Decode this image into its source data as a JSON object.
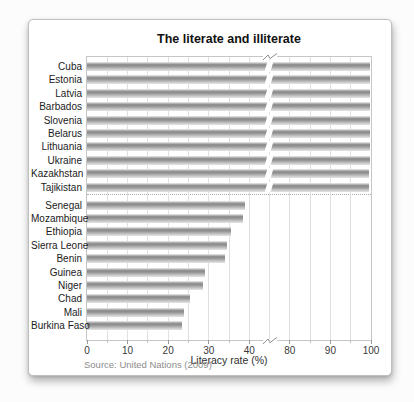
{
  "card": {
    "title": "The literate and illiterate",
    "xlabel": "Literacy rate (%)",
    "source": "Source: United Nations (2009)"
  },
  "chart_data": {
    "type": "bar",
    "orientation": "horizontal",
    "title": "The literate and illiterate",
    "xlabel": "Literacy rate (%)",
    "source": "Source: United Nations (2009)",
    "axis": {
      "unit": "%",
      "tick_labels": [
        "0",
        "10",
        "20",
        "30",
        "40",
        "80",
        "90",
        "100"
      ],
      "tick_slots": [
        0,
        2,
        4,
        6,
        8,
        10,
        12,
        14
      ],
      "slots_total": 14,
      "units_per_slot": 5,
      "break": {
        "between": [
          40,
          80
        ],
        "slot": 9
      },
      "gridlines": true,
      "separator_after_group": 0
    },
    "groups": [
      {
        "label": "high literacy",
        "rows": [
          {
            "country": "Cuba",
            "value": 99.8
          },
          {
            "country": "Estonia",
            "value": 99.8
          },
          {
            "country": "Latvia",
            "value": 99.8
          },
          {
            "country": "Barbados",
            "value": 99.7
          },
          {
            "country": "Slovenia",
            "value": 99.7
          },
          {
            "country": "Belarus",
            "value": 99.7
          },
          {
            "country": "Lithuania",
            "value": 99.7
          },
          {
            "country": "Ukraine",
            "value": 99.7
          },
          {
            "country": "Kazakhstan",
            "value": 99.6
          },
          {
            "country": "Tajikistan",
            "value": 99.6
          }
        ]
      },
      {
        "label": "low literacy",
        "rows": [
          {
            "country": "Senegal",
            "value": 39
          },
          {
            "country": "Mozambique",
            "value": 38.5
          },
          {
            "country": "Ethiopia",
            "value": 35.5
          },
          {
            "country": "Sierra Leone",
            "value": 34.5
          },
          {
            "country": "Benin",
            "value": 34
          },
          {
            "country": "Guinea",
            "value": 29
          },
          {
            "country": "Niger",
            "value": 28.5
          },
          {
            "country": "Chad",
            "value": 25.5
          },
          {
            "country": "Mali",
            "value": 24
          },
          {
            "country": "Burkina Faso",
            "value": 23.5
          }
        ]
      }
    ],
    "colors": {
      "bar_dark": "#8a8a8a",
      "bar_light": "#e2e2e2",
      "frame": "#c6c6c6",
      "gridline": "#e0e0e0",
      "label_text": "#1b1b1b",
      "source_text": "#8c8c8c",
      "card_background": "#ffffff"
    }
  }
}
